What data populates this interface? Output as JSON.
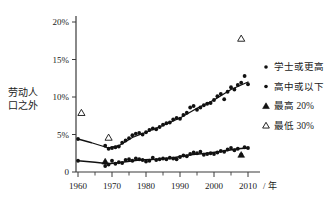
{
  "chart_data": {
    "type": "scatter",
    "title": "",
    "xlabel": "/ 年",
    "ylabel_lines": [
      "劳动人",
      "口之外"
    ],
    "xlim": [
      1958,
      2012
    ],
    "ylim": [
      0,
      20
    ],
    "grid": false,
    "xticks": [
      1960,
      1970,
      1980,
      1990,
      2000,
      2010
    ],
    "xtick_labels": [
      "1960",
      "1970",
      "1980",
      "1990",
      "2000",
      "2010"
    ],
    "xticks_minor": [
      1965,
      1975,
      1985,
      1995,
      2005
    ],
    "yticks": [
      0,
      5,
      10,
      15,
      20
    ],
    "ytick_labels": [
      "0",
      "5%",
      "10%",
      "15%",
      "20%"
    ],
    "legend_position": "right",
    "legend": [
      {
        "label": "学士或更高",
        "marker": "filled-dot"
      },
      {
        "label": "高中或以下",
        "marker": "filled-dot"
      },
      {
        "label": "最高 20%",
        "marker": "filled-triangle"
      },
      {
        "label": "最低 30%",
        "marker": "open-triangle"
      }
    ],
    "series": [
      {
        "name": "高中或以下",
        "marker": "filled-dot",
        "points": [
          {
            "x": 1960,
            "y": 4.4
          },
          {
            "x": 1968,
            "y": 3.5
          },
          {
            "x": 1969,
            "y": 3.1
          },
          {
            "x": 1970,
            "y": 3.2
          },
          {
            "x": 1971,
            "y": 3.3
          },
          {
            "x": 1972,
            "y": 3.4
          },
          {
            "x": 1973,
            "y": 3.9
          },
          {
            "x": 1974,
            "y": 4.2
          },
          {
            "x": 1975,
            "y": 4.5
          },
          {
            "x": 1976,
            "y": 4.9
          },
          {
            "x": 1977,
            "y": 5.1
          },
          {
            "x": 1978,
            "y": 5.2
          },
          {
            "x": 1979,
            "y": 5.0
          },
          {
            "x": 1980,
            "y": 5.3
          },
          {
            "x": 1981,
            "y": 5.6
          },
          {
            "x": 1982,
            "y": 5.8
          },
          {
            "x": 1983,
            "y": 5.7
          },
          {
            "x": 1984,
            "y": 6.0
          },
          {
            "x": 1985,
            "y": 6.3
          },
          {
            "x": 1986,
            "y": 6.5
          },
          {
            "x": 1987,
            "y": 6.6
          },
          {
            "x": 1988,
            "y": 7.0
          },
          {
            "x": 1989,
            "y": 7.2
          },
          {
            "x": 1990,
            "y": 7.1
          },
          {
            "x": 1991,
            "y": 7.6
          },
          {
            "x": 1992,
            "y": 7.9
          },
          {
            "x": 1993,
            "y": 8.6
          },
          {
            "x": 1994,
            "y": 8.8
          },
          {
            "x": 1995,
            "y": 8.3
          },
          {
            "x": 1996,
            "y": 8.6
          },
          {
            "x": 1997,
            "y": 8.9
          },
          {
            "x": 1998,
            "y": 9.1
          },
          {
            "x": 1999,
            "y": 9.2
          },
          {
            "x": 2000,
            "y": 9.6
          },
          {
            "x": 2001,
            "y": 10.1
          },
          {
            "x": 2002,
            "y": 10.4
          },
          {
            "x": 2003,
            "y": 9.7
          },
          {
            "x": 2004,
            "y": 10.7
          },
          {
            "x": 2005,
            "y": 11.3
          },
          {
            "x": 2006,
            "y": 11.0
          },
          {
            "x": 2007,
            "y": 11.6
          },
          {
            "x": 2008,
            "y": 11.9
          },
          {
            "x": 2009,
            "y": 12.8
          },
          {
            "x": 2010,
            "y": 11.7
          }
        ],
        "trend": [
          {
            "x": 1960,
            "y": 4.4
          },
          {
            "x": 1964,
            "y": 3.9
          },
          {
            "x": 1969,
            "y": 3.2
          },
          {
            "x": 1972,
            "y": 3.5
          },
          {
            "x": 1976,
            "y": 4.6
          },
          {
            "x": 1980,
            "y": 5.3
          },
          {
            "x": 1985,
            "y": 6.2
          },
          {
            "x": 1990,
            "y": 7.2
          },
          {
            "x": 1995,
            "y": 8.5
          },
          {
            "x": 2000,
            "y": 9.6
          },
          {
            "x": 2005,
            "y": 11.0
          },
          {
            "x": 2010,
            "y": 12.0
          }
        ]
      },
      {
        "name": "学士或更高",
        "marker": "filled-dot",
        "points": [
          {
            "x": 1960,
            "y": 1.5
          },
          {
            "x": 1968,
            "y": 0.8
          },
          {
            "x": 1969,
            "y": 1.0
          },
          {
            "x": 1970,
            "y": 1.5
          },
          {
            "x": 1971,
            "y": 1.1
          },
          {
            "x": 1972,
            "y": 1.3
          },
          {
            "x": 1973,
            "y": 1.2
          },
          {
            "x": 1974,
            "y": 1.6
          },
          {
            "x": 1975,
            "y": 1.7
          },
          {
            "x": 1976,
            "y": 1.5
          },
          {
            "x": 1977,
            "y": 1.8
          },
          {
            "x": 1978,
            "y": 1.7
          },
          {
            "x": 1979,
            "y": 1.6
          },
          {
            "x": 1980,
            "y": 1.4
          },
          {
            "x": 1981,
            "y": 1.5
          },
          {
            "x": 1982,
            "y": 1.9
          },
          {
            "x": 1983,
            "y": 1.6
          },
          {
            "x": 1984,
            "y": 1.7
          },
          {
            "x": 1985,
            "y": 1.8
          },
          {
            "x": 1986,
            "y": 1.7
          },
          {
            "x": 1987,
            "y": 1.9
          },
          {
            "x": 1988,
            "y": 1.8
          },
          {
            "x": 1989,
            "y": 1.7
          },
          {
            "x": 1990,
            "y": 2.0
          },
          {
            "x": 1991,
            "y": 2.2
          },
          {
            "x": 1992,
            "y": 2.1
          },
          {
            "x": 1993,
            "y": 2.4
          },
          {
            "x": 1994,
            "y": 2.6
          },
          {
            "x": 1995,
            "y": 2.5
          },
          {
            "x": 1996,
            "y": 2.7
          },
          {
            "x": 1997,
            "y": 2.3
          },
          {
            "x": 1998,
            "y": 2.4
          },
          {
            "x": 1999,
            "y": 2.5
          },
          {
            "x": 2000,
            "y": 2.4
          },
          {
            "x": 2001,
            "y": 2.6
          },
          {
            "x": 2002,
            "y": 2.8
          },
          {
            "x": 2003,
            "y": 2.7
          },
          {
            "x": 2004,
            "y": 3.0
          },
          {
            "x": 2005,
            "y": 3.2
          },
          {
            "x": 2006,
            "y": 2.9
          },
          {
            "x": 2007,
            "y": 3.1
          },
          {
            "x": 2008,
            "y": 2.3
          },
          {
            "x": 2009,
            "y": 3.3
          },
          {
            "x": 2010,
            "y": 3.2
          }
        ],
        "trend": [
          {
            "x": 1960,
            "y": 1.5
          },
          {
            "x": 1965,
            "y": 1.3
          },
          {
            "x": 1969,
            "y": 1.1
          },
          {
            "x": 1973,
            "y": 1.3
          },
          {
            "x": 1978,
            "y": 1.6
          },
          {
            "x": 1983,
            "y": 1.7
          },
          {
            "x": 1988,
            "y": 1.9
          },
          {
            "x": 1993,
            "y": 2.3
          },
          {
            "x": 1998,
            "y": 2.5
          },
          {
            "x": 2003,
            "y": 2.8
          },
          {
            "x": 2007,
            "y": 3.1
          },
          {
            "x": 2010,
            "y": 3.2
          }
        ]
      }
    ],
    "markers_special": [
      {
        "series": "最低 30%",
        "marker": "open-triangle",
        "x": 1961,
        "y": 7.9
      },
      {
        "series": "最低 30%",
        "marker": "open-triangle",
        "x": 1969,
        "y": 4.6
      },
      {
        "series": "最低 30%",
        "marker": "open-triangle",
        "x": 2008,
        "y": 17.8
      },
      {
        "series": "最高 20%",
        "marker": "filled-triangle",
        "x": 1968,
        "y": 1.4
      },
      {
        "series": "最高 20%",
        "marker": "filled-triangle",
        "x": 2008,
        "y": 2.3
      }
    ]
  }
}
